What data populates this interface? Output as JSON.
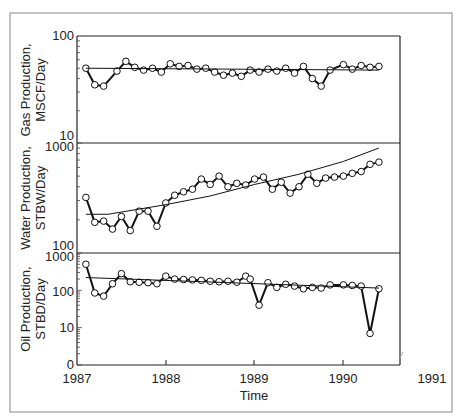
{
  "chart_data": [
    {
      "type": "line",
      "panel": "gas",
      "ylabel_line1": "Gas Production,",
      "ylabel_line2": "MSCF/Day",
      "yscale": "log",
      "ylim": [
        10,
        100
      ],
      "ytick_labels": [
        "10",
        "100"
      ],
      "series": [
        {
          "name": "Actual",
          "marker": "open-circle",
          "x": [
            1987.1,
            1987.2,
            1987.3,
            1987.45,
            1987.55,
            1987.65,
            1987.75,
            1987.85,
            1987.95,
            1988.05,
            1988.15,
            1988.25,
            1988.35,
            1988.45,
            1988.55,
            1988.65,
            1988.75,
            1988.85,
            1988.95,
            1989.05,
            1989.15,
            1989.25,
            1989.35,
            1989.45,
            1989.55,
            1989.65,
            1989.75,
            1989.85,
            1990.0,
            1990.1,
            1990.2,
            1990.3,
            1990.4
          ],
          "values": [
            50,
            35,
            34,
            47,
            58,
            51,
            48,
            50,
            46,
            55,
            52,
            53,
            49,
            50,
            46,
            43,
            45,
            42,
            48,
            46,
            49,
            47,
            50,
            45,
            52,
            40,
            34,
            48,
            54,
            49,
            53,
            51,
            52
          ]
        },
        {
          "name": "Forecast",
          "marker": "none",
          "x": [
            1987.1,
            1990.4
          ],
          "values": [
            50,
            48
          ]
        }
      ]
    },
    {
      "type": "line",
      "panel": "water",
      "ylabel_line1": "Water Production,",
      "ylabel_line2": "STBW/Day",
      "yscale": "log",
      "ylim": [
        100,
        1000
      ],
      "ytick_labels": [
        "100",
        "1000"
      ],
      "series": [
        {
          "name": "Actual",
          "marker": "open-circle",
          "x": [
            1987.1,
            1987.2,
            1987.3,
            1987.4,
            1987.5,
            1987.6,
            1987.7,
            1987.8,
            1987.9,
            1988.0,
            1988.1,
            1988.2,
            1988.3,
            1988.4,
            1988.5,
            1988.6,
            1988.7,
            1988.8,
            1988.9,
            1989.0,
            1989.1,
            1989.2,
            1989.3,
            1989.4,
            1989.5,
            1989.6,
            1989.7,
            1989.8,
            1989.9,
            1990.0,
            1990.1,
            1990.2,
            1990.3,
            1990.4
          ],
          "values": [
            320,
            190,
            195,
            165,
            215,
            160,
            240,
            240,
            175,
            285,
            335,
            360,
            380,
            470,
            420,
            500,
            400,
            430,
            415,
            470,
            490,
            380,
            440,
            350,
            400,
            520,
            430,
            480,
            490,
            500,
            530,
            550,
            640,
            670
          ]
        },
        {
          "name": "Forecast",
          "marker": "none",
          "x": [
            1987.1,
            1987.35,
            1988.0,
            1988.5,
            1989.0,
            1989.5,
            1990.0,
            1990.4
          ],
          "values": [
            225,
            225,
            275,
            330,
            420,
            520,
            680,
            900
          ]
        }
      ]
    },
    {
      "type": "line",
      "panel": "oil",
      "ylabel_line1": "Oil Production,",
      "ylabel_line2": "STBD/Day",
      "yscale": "log",
      "ylim": [
        0,
        1000
      ],
      "ytick_labels": [
        "0",
        "10",
        "100",
        "1000"
      ],
      "series": [
        {
          "name": "Actual",
          "marker": "open-circle",
          "x": [
            1987.1,
            1987.2,
            1987.3,
            1987.4,
            1987.5,
            1987.6,
            1987.7,
            1987.8,
            1987.9,
            1988.0,
            1988.1,
            1988.2,
            1988.3,
            1988.4,
            1988.5,
            1988.6,
            1988.7,
            1988.8,
            1988.9,
            1988.95,
            1989.05,
            1989.15,
            1989.25,
            1989.35,
            1989.45,
            1989.55,
            1989.65,
            1989.75,
            1989.85,
            1990.0,
            1990.1,
            1990.2,
            1990.3,
            1990.4
          ],
          "values": [
            500,
            85,
            70,
            150,
            280,
            170,
            165,
            160,
            150,
            240,
            200,
            195,
            190,
            185,
            175,
            170,
            175,
            165,
            240,
            200,
            40,
            160,
            120,
            145,
            130,
            110,
            120,
            115,
            140,
            140,
            135,
            130,
            7,
            110
          ],
          "notes": "Drops to ~40 at early 1989 and ~7 at 1990.3"
        },
        {
          "name": "Forecast",
          "marker": "none",
          "x": [
            1987.1,
            1990.4
          ],
          "values": [
            220,
            115
          ]
        }
      ]
    }
  ],
  "xaxis": {
    "label": "Time",
    "ticks": [
      "1987",
      "1988",
      "1989",
      "1990",
      "1991"
    ],
    "xlim": [
      1987,
      1990.63
    ]
  },
  "labels": {
    "gas_ylabel_1": "Gas Production,",
    "gas_ylabel_2": "MSCF/Day",
    "water_ylabel_1": "Water Production,",
    "water_ylabel_2": "STBW/Day",
    "oil_ylabel_1": "Oil Production,",
    "oil_ylabel_2": "STBD/Day",
    "gas_ytop": "100",
    "gas_ybottom": "10",
    "water_ytop": "1000",
    "water_ybottom": "100",
    "oil_ytop": "1000",
    "oil_y100": "100",
    "oil_y10": "10",
    "oil_y0": "0",
    "x_1987": "1987",
    "x_1988": "1988",
    "x_1989": "1989",
    "x_1990": "1990",
    "x_1991": "1991",
    "xlabel": "Time"
  }
}
